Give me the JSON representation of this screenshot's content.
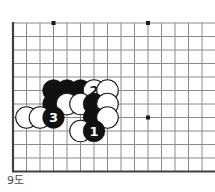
{
  "figure": {
    "caption": "9도",
    "type": "go-board-diagram"
  },
  "board": {
    "geometry": {
      "origin_x": 13,
      "origin_y": 23,
      "spacing": 13.5,
      "cols": 15,
      "rows": 11,
      "stone_radius": 10.8
    },
    "colors": {
      "background": "#ffffff",
      "grid_line": "#8a8a8a",
      "edge_line": "#404040",
      "black_stone": "#111111",
      "white_stone": "#ffffff",
      "white_stone_border": "#1a1a1a",
      "star_point": "#1a1a1a",
      "caption_text": "#4a4a4a"
    },
    "edges": {
      "left": true,
      "top": false,
      "bottom": true,
      "right": false
    },
    "star_points": [
      {
        "col": 3,
        "row": 0
      },
      {
        "col": 10,
        "row": 0
      },
      {
        "col": 10,
        "row": 7
      }
    ],
    "stones": [
      {
        "col": 3,
        "row": 5,
        "color": "black",
        "label": ""
      },
      {
        "col": 4,
        "row": 5,
        "color": "black",
        "label": ""
      },
      {
        "col": 5,
        "row": 5,
        "color": "black",
        "label": ""
      },
      {
        "col": 6,
        "row": 5,
        "color": "white",
        "label": "2"
      },
      {
        "col": 7,
        "row": 5,
        "color": "white",
        "label": ""
      },
      {
        "col": 3,
        "row": 6,
        "color": "black",
        "label": ""
      },
      {
        "col": 4,
        "row": 6,
        "color": "white",
        "label": ""
      },
      {
        "col": 5,
        "row": 6,
        "color": "white",
        "label": ""
      },
      {
        "col": 6,
        "row": 6,
        "color": "black",
        "label": ""
      },
      {
        "col": 7,
        "row": 6,
        "color": "white",
        "label": ""
      },
      {
        "col": 1,
        "row": 7,
        "color": "white",
        "label": ""
      },
      {
        "col": 2,
        "row": 7,
        "color": "white",
        "label": ""
      },
      {
        "col": 3,
        "row": 7,
        "color": "black",
        "label": "3"
      },
      {
        "col": 6,
        "row": 7,
        "color": "black",
        "label": ""
      },
      {
        "col": 7,
        "row": 7,
        "color": "white",
        "label": ""
      },
      {
        "col": 5,
        "row": 8,
        "color": "white",
        "label": ""
      },
      {
        "col": 6,
        "row": 8,
        "color": "black",
        "label": "1"
      }
    ]
  }
}
